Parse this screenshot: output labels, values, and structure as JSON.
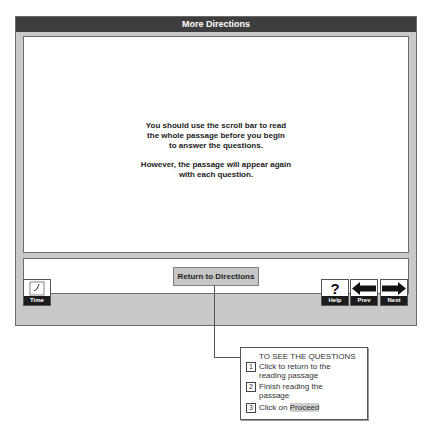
{
  "window": {
    "title": "More Directions"
  },
  "main": {
    "paragraphs": [
      "You should use the scroll bar to read\nthe whole passage before you begin\nto answer the questions.",
      "However, the passage will appear again\nwith each question."
    ]
  },
  "lower": {
    "return_button": "Return to Directions"
  },
  "toolbar": {
    "time": {
      "label": "Time",
      "icon": "clock-icon"
    },
    "help": {
      "label": "Help",
      "icon": "question-mark-icon",
      "glyph": "?"
    },
    "prev": {
      "label": "Prev",
      "icon": "arrow-left-icon"
    },
    "next": {
      "label": "Next",
      "icon": "arrow-right-icon"
    }
  },
  "callout": {
    "heading": "TO SEE THE QUESTIONS",
    "steps": [
      {
        "num": "1",
        "text": "Click to return to the\nreading passage"
      },
      {
        "num": "2",
        "text": "Finish reading the\npassage"
      },
      {
        "num": "3",
        "text_prefix": "Click on ",
        "highlight": "Proceed"
      }
    ]
  },
  "colors": {
    "titlebar": "#3e3e3e",
    "frame": "#c9c9c9",
    "button": "#c6c6c6"
  }
}
